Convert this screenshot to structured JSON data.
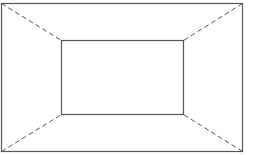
{
  "diagram": {
    "type": "perspective-box",
    "stroke_color": "#555555",
    "background": "#ffffff",
    "outer_rect": {
      "x": 1.5,
      "y": 3.5,
      "width": 241,
      "height": 148
    },
    "inner_rect": {
      "x": 61.5,
      "y": 40.5,
      "width": 122,
      "height": 74
    },
    "connectors_style": "dashed"
  }
}
